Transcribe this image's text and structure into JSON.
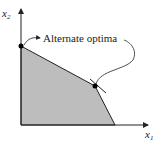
{
  "diagram": {
    "axis_x_label": "x",
    "axis_x_sub": "1",
    "axis_y_label": "x",
    "axis_y_sub": "2",
    "annotation": "Alternate optima",
    "colors": {
      "feasible_region": "#bdbdbd",
      "line": "#222222"
    }
  }
}
